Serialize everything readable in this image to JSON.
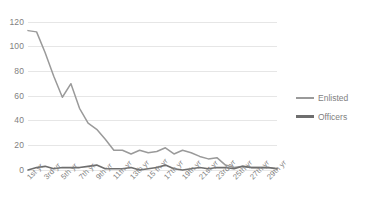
{
  "chart_data": {
    "type": "line",
    "title": "",
    "xlabel": "",
    "ylabel": "",
    "ylim": [
      0,
      120
    ],
    "yticks": [
      0,
      20,
      40,
      60,
      80,
      100,
      120
    ],
    "grid": true,
    "legend_position": "right",
    "categories": [
      "1st yr",
      "2nd yr",
      "3rd yr",
      "4th yr",
      "5th yr",
      "6th yr",
      "7th yr",
      "8th yr",
      "9th yr",
      "10th yr",
      "11th yr",
      "12th yr",
      "13th yr",
      "14th yr",
      "15 th yr",
      "16th yr",
      "17th yr",
      "18th yr",
      "19th yr",
      "20th yr",
      "21st yr",
      "22nd yr",
      "23rd yr",
      "24th yr",
      "25th yr",
      "26th yr",
      "27th yr",
      "28th yr",
      "29th yr",
      "30th yr"
    ],
    "tick_labels": [
      "1st yr",
      "3rd yr",
      "5th yr",
      "7th yr",
      "9th yr",
      "11th yr",
      "13th yr",
      "15 th yr",
      "17th yr",
      "19th yr",
      "21st yr",
      "23rd yr",
      "25th yr",
      "27th yr",
      "29th yr"
    ],
    "series": [
      {
        "name": "Enlisted",
        "color": "#9a9a9a",
        "values": [
          113,
          112,
          95,
          76,
          59,
          70,
          50,
          38,
          33,
          25,
          16,
          16,
          13,
          16,
          14,
          15,
          18,
          13,
          16,
          14,
          11,
          9,
          10,
          4,
          2,
          3,
          2,
          2,
          2,
          1
        ]
      },
      {
        "name": "Officers",
        "color": "#6e6e6e",
        "values": [
          0,
          2,
          3,
          1,
          2,
          2,
          2,
          3,
          4,
          1,
          1,
          1,
          2,
          0,
          1,
          2,
          4,
          1,
          0,
          1,
          2,
          1,
          2,
          2,
          1,
          3,
          2,
          2,
          2,
          1
        ]
      }
    ]
  },
  "legend": {
    "items": [
      {
        "label": "Enlisted"
      },
      {
        "label": "Officers"
      }
    ]
  },
  "colors": {
    "gridline": "#e6e6e6",
    "tick_text": "#7f7f7f",
    "enlisted": "#9a9a9a",
    "officers": "#6e6e6e",
    "background": "#ffffff"
  }
}
